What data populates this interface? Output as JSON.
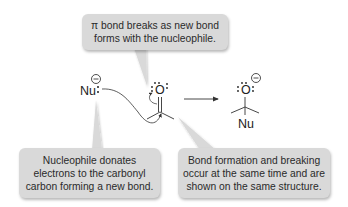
{
  "callouts": {
    "top": {
      "lines": [
        "π bond breaks as new bond",
        "forms with the nucleophile."
      ]
    },
    "bottom_left": {
      "lines": [
        "Nucleophile donates",
        "electrons to the carbonyl",
        "carbon forming a new bond."
      ]
    },
    "bottom_right": {
      "lines": [
        "Bond formation and breaking",
        "occur at the same time and are",
        "shown on the same structure."
      ]
    }
  },
  "reactant": {
    "nucleophile": {
      "label": "Nu",
      "charge": "negative",
      "lone_pairs": 1
    },
    "carbonyl": {
      "atom": "O",
      "lone_pairs": 2,
      "bond": "C=O",
      "substituents": 2
    }
  },
  "reaction_arrow": {
    "direction": "right"
  },
  "product": {
    "atom": "O",
    "charge": "negative",
    "lone_pairs": 3,
    "substituent_label": "Nu"
  },
  "colors": {
    "callout_fill": "#d9d9d9",
    "text": "#222222",
    "lines": "#333333"
  }
}
